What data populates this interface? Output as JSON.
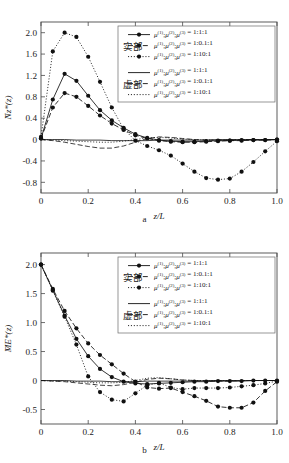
{
  "figure": {
    "panels": [
      {
        "id": "a",
        "caption": "a"
      },
      {
        "id": "b",
        "caption": "b"
      }
    ]
  },
  "legend": {
    "group_real_label": "实部",
    "group_imag_label": "虚部",
    "mu_symbol": "μ",
    "entries": [
      {
        "ratio": "1:1:1",
        "style": "solid-marker",
        "group": "实部"
      },
      {
        "ratio": "1:0.1:1",
        "style": "dashed-marker",
        "group": "实部"
      },
      {
        "ratio": "1:10:1",
        "style": "dotted-marker",
        "group": "实部"
      },
      {
        "ratio": "1:1:1",
        "style": "solid",
        "group": "虚部"
      },
      {
        "ratio": "1:0.1:1",
        "style": "dashed",
        "group": "虚部"
      },
      {
        "ratio": "1:10:1",
        "style": "dotted",
        "group": "虚部"
      }
    ],
    "label_prefix": "μ(1);μ(2);μ(3) =",
    "superscripts": [
      "(1)",
      "(2)",
      "(3)"
    ]
  },
  "chart_data": [
    {
      "type": "line",
      "panel": "a",
      "title": "",
      "xlabel": "z/L",
      "ylabel": "N̄z*(z)",
      "xlim": [
        0,
        1.0
      ],
      "ylim": [
        -1.0,
        2.2
      ],
      "xticks": [
        0,
        0.2,
        0.4,
        0.6,
        0.8,
        1.0
      ],
      "xticklabels": [
        "0",
        "0.2",
        "0.4",
        "0.6",
        "0.8",
        "1.0"
      ],
      "yticks": [
        -0.8,
        -0.4,
        0,
        0.4,
        0.8,
        1.2,
        1.6,
        2.0
      ],
      "yticklabels": [
        "-0.8",
        "-0.4",
        "0",
        "0.4",
        "0.8",
        "1.2",
        "1.6",
        "2.0"
      ],
      "grid": false,
      "legend_position": "top-right",
      "x": [
        0,
        0.05,
        0.1,
        0.15,
        0.2,
        0.25,
        0.3,
        0.35,
        0.4,
        0.45,
        0.5,
        0.55,
        0.6,
        0.65,
        0.7,
        0.75,
        0.8,
        0.85,
        0.9,
        0.95,
        1.0
      ],
      "series": [
        {
          "name": "实部 1:1:1",
          "style": "solid-marker",
          "values": [
            0.02,
            0.75,
            1.23,
            1.1,
            0.82,
            0.55,
            0.36,
            0.22,
            0.1,
            0.03,
            -0.01,
            -0.03,
            -0.04,
            -0.04,
            -0.03,
            -0.02,
            -0.02,
            -0.01,
            -0.01,
            -0.01,
            0.0
          ]
        },
        {
          "name": "实部 1:0.1:1",
          "style": "dashed-marker",
          "values": [
            0.02,
            0.6,
            0.87,
            0.8,
            0.63,
            0.45,
            0.3,
            0.18,
            0.08,
            0.02,
            -0.02,
            -0.04,
            -0.05,
            -0.05,
            -0.04,
            -0.03,
            -0.02,
            -0.02,
            -0.01,
            -0.01,
            0.0
          ]
        },
        {
          "name": "实部 1:10:1",
          "style": "dotted-marker",
          "values": [
            0.05,
            1.65,
            2.0,
            1.92,
            1.55,
            1.08,
            0.6,
            0.2,
            -0.02,
            -0.12,
            -0.2,
            -0.3,
            -0.45,
            -0.6,
            -0.72,
            -0.75,
            -0.73,
            -0.6,
            -0.42,
            -0.22,
            -0.03
          ]
        },
        {
          "name": "虚部 1:1:1",
          "style": "solid",
          "values": [
            0.0,
            0.0,
            0.0,
            -0.01,
            -0.01,
            -0.01,
            -0.02,
            -0.02,
            -0.02,
            -0.02,
            -0.01,
            -0.01,
            -0.01,
            -0.01,
            -0.01,
            0.0,
            0.0,
            0.0,
            0.0,
            0.0,
            0.0
          ]
        },
        {
          "name": "虚部 1:0.1:1",
          "style": "dashed",
          "values": [
            0.0,
            -0.02,
            -0.05,
            -0.09,
            -0.13,
            -0.16,
            -0.16,
            -0.12,
            -0.05,
            0.02,
            0.05,
            0.04,
            0.02,
            0.0,
            -0.01,
            -0.01,
            -0.01,
            0.0,
            0.0,
            0.0,
            0.0
          ]
        },
        {
          "name": "虚部 1:10:1",
          "style": "dotted",
          "values": [
            0.0,
            -0.01,
            -0.02,
            -0.03,
            -0.04,
            -0.05,
            -0.05,
            -0.03,
            0.0,
            0.03,
            0.04,
            0.03,
            0.01,
            0.0,
            -0.01,
            -0.01,
            -0.01,
            0.0,
            0.0,
            0.0,
            0.0
          ]
        }
      ]
    },
    {
      "type": "line",
      "panel": "b",
      "title": "",
      "xlabel": "z/L",
      "ylabel": "M̄E*(z)",
      "xlim": [
        0,
        1.0
      ],
      "ylim": [
        -0.75,
        2.2
      ],
      "xticks": [
        0,
        0.2,
        0.4,
        0.6,
        0.8,
        1.0
      ],
      "xticklabels": [
        "0",
        "0.2",
        "0.4",
        "0.6",
        "0.8",
        "1.0"
      ],
      "yticks": [
        -0.5,
        0,
        0.5,
        1.0,
        1.5,
        2.0
      ],
      "yticklabels": [
        "-0.5",
        "0",
        "0.5",
        "1.0",
        "1.5",
        "2.0"
      ],
      "grid": false,
      "legend_position": "top-right",
      "x": [
        0,
        0.05,
        0.1,
        0.15,
        0.2,
        0.25,
        0.3,
        0.35,
        0.4,
        0.45,
        0.5,
        0.55,
        0.6,
        0.65,
        0.7,
        0.75,
        0.8,
        0.85,
        0.9,
        0.95,
        1.0
      ],
      "series": [
        {
          "name": "实部 1:1:1",
          "style": "solid-marker",
          "values": [
            2.0,
            1.56,
            1.12,
            0.72,
            0.42,
            0.2,
            0.06,
            -0.02,
            -0.05,
            -0.06,
            -0.05,
            -0.04,
            -0.03,
            -0.02,
            -0.02,
            -0.01,
            -0.01,
            -0.01,
            0.0,
            0.0,
            0.0
          ]
        },
        {
          "name": "实部 1:0.1:1",
          "style": "dashed-marker",
          "values": [
            2.0,
            1.58,
            1.2,
            0.9,
            0.64,
            0.44,
            0.28,
            0.12,
            -0.02,
            -0.12,
            -0.14,
            -0.13,
            -0.2,
            -0.27,
            -0.35,
            -0.45,
            -0.47,
            -0.47,
            -0.38,
            -0.18,
            -0.02
          ]
        },
        {
          "name": "实部 1:10:1",
          "style": "dotted-marker",
          "values": [
            2.0,
            1.55,
            1.1,
            0.62,
            0.07,
            -0.2,
            -0.33,
            -0.36,
            -0.22,
            -0.08,
            -0.04,
            -0.12,
            -0.15,
            -0.13,
            -0.13,
            -0.13,
            -0.12,
            -0.1,
            -0.08,
            -0.05,
            -0.01
          ]
        },
        {
          "name": "虚部 1:1:1",
          "style": "solid",
          "values": [
            0.0,
            0.0,
            0.0,
            -0.01,
            -0.01,
            -0.01,
            -0.02,
            -0.02,
            -0.02,
            -0.01,
            -0.01,
            -0.01,
            -0.01,
            -0.01,
            0.0,
            0.0,
            0.0,
            0.0,
            0.0,
            0.0,
            0.0
          ]
        },
        {
          "name": "虚部 1:0.1:1",
          "style": "dashed",
          "values": [
            0.0,
            -0.01,
            -0.02,
            -0.04,
            -0.06,
            -0.08,
            -0.09,
            -0.07,
            -0.03,
            0.02,
            0.04,
            0.03,
            0.01,
            0.0,
            -0.01,
            -0.01,
            -0.01,
            0.0,
            0.0,
            0.0,
            0.0
          ]
        },
        {
          "name": "虚部 1:10:1",
          "style": "dotted",
          "values": [
            0.0,
            -0.01,
            -0.01,
            -0.02,
            -0.03,
            -0.04,
            -0.04,
            -0.03,
            0.0,
            0.04,
            0.05,
            0.03,
            0.01,
            0.0,
            0.0,
            0.0,
            0.0,
            0.0,
            0.0,
            0.0,
            0.0
          ]
        }
      ]
    }
  ]
}
